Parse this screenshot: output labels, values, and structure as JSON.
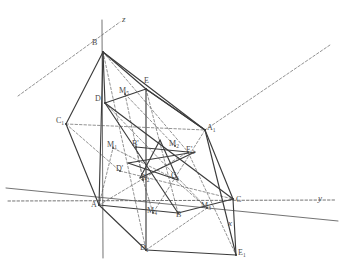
{
  "figure": {
    "width": 342,
    "height": 278,
    "background": "#ffffff",
    "solid_stroke": "#3c3c3c",
    "dashed_stroke": "#6e6e6e",
    "axis_stroke": "#5a5a5a",
    "label_color": "#4a4a4a"
  },
  "axes": [
    {
      "name": "z",
      "label": "z",
      "kind": "solid",
      "x1": 102,
      "y1": 20,
      "x2": 103,
      "y2": 258,
      "label_x": 122,
      "label_y": 20
    },
    {
      "name": "y",
      "label": "y",
      "kind": "dashed",
      "x1": 8,
      "y1": 201,
      "x2": 336,
      "y2": 200,
      "label_x": 318,
      "label_y": 199
    },
    {
      "name": "x",
      "label": "x",
      "kind": "solid",
      "x1": 6,
      "y1": 188,
      "x2": 338,
      "y2": 221,
      "label_x": 228,
      "label_y": 224
    }
  ],
  "points": [
    {
      "name": "A",
      "label": "A",
      "x": 99,
      "y": 205,
      "label_x": 91,
      "label_y": 206
    },
    {
      "name": "B",
      "label": "B",
      "x": 103,
      "y": 52,
      "label_x": 92,
      "label_y": 44
    },
    {
      "name": "C",
      "label": "C",
      "x": 233,
      "y": 199,
      "label_x": 236,
      "label_y": 201
    },
    {
      "name": "D",
      "label": "D",
      "x": 105,
      "y": 103,
      "label_x": 95,
      "label_y": 100
    },
    {
      "name": "E",
      "label": "E",
      "x": 146,
      "y": 89,
      "label_x": 144,
      "label_y": 82
    },
    {
      "name": "A1",
      "label": "A",
      "sub": "1",
      "x": 205,
      "y": 130,
      "label_x": 207,
      "label_y": 129
    },
    {
      "name": "C1",
      "label": "C",
      "sub": "1",
      "x": 66,
      "y": 124,
      "label_x": 56,
      "label_y": 122
    },
    {
      "name": "D1",
      "label": "D",
      "sub": "1",
      "x": 146,
      "y": 250,
      "label_x": 140,
      "label_y": 249
    },
    {
      "name": "E1",
      "label": "E",
      "sub": "1",
      "x": 236,
      "y": 255,
      "label_x": 238,
      "label_y": 254
    },
    {
      "name": "B2",
      "label": "B",
      "x": 178,
      "y": 213,
      "label_x": 176,
      "label_y": 216
    },
    {
      "name": "Bp",
      "label": "B",
      "prime": true,
      "x": 136,
      "y": 147,
      "label_x": 132,
      "label_y": 145
    },
    {
      "name": "Dp",
      "label": "D",
      "prime": true,
      "x": 120,
      "y": 171,
      "label_x": 116,
      "label_y": 170
    },
    {
      "name": "A2",
      "label": "A",
      "sub": "2",
      "x": 143,
      "y": 180,
      "label_x": 141,
      "label_y": 179
    },
    {
      "name": "C1b",
      "label": "C",
      "sub": "1",
      "x": 173,
      "y": 178,
      "label_x": 171,
      "label_y": 177
    },
    {
      "name": "E1p",
      "label": "E",
      "sub": "1",
      "prime": true,
      "x": 188,
      "y": 152,
      "label_x": 186,
      "label_y": 151
    },
    {
      "name": "M1",
      "label": "M",
      "sub": "1",
      "x": 113,
      "y": 148,
      "label_x": 107,
      "label_y": 146
    },
    {
      "name": "M2",
      "label": "M",
      "sub": "2",
      "x": 175,
      "y": 146,
      "label_x": 169,
      "label_y": 145
    },
    {
      "name": "M3",
      "label": "M",
      "sub": "3",
      "x": 207,
      "y": 208,
      "label_x": 201,
      "label_y": 207
    },
    {
      "name": "M4",
      "label": "M",
      "sub": "4",
      "x": 153,
      "y": 213,
      "label_x": 147,
      "label_y": 212
    },
    {
      "name": "M5",
      "label": "M",
      "sub": "5",
      "x": 125,
      "y": 94,
      "label_x": 119,
      "label_y": 92
    }
  ],
  "solid_edges": [
    {
      "name": "edge-B-C1",
      "x1": 103,
      "y1": 52,
      "x2": 66,
      "y2": 124
    },
    {
      "name": "edge-C1-A",
      "x1": 66,
      "y1": 124,
      "x2": 99,
      "y2": 205
    },
    {
      "name": "edge-B-D",
      "x1": 103,
      "y1": 52,
      "x2": 105,
      "y2": 103
    },
    {
      "name": "edge-B-E",
      "x1": 103,
      "y1": 52,
      "x2": 146,
      "y2": 89
    },
    {
      "name": "edge-D-E",
      "x1": 105,
      "y1": 103,
      "x2": 146,
      "y2": 89
    },
    {
      "name": "edge-B-A1",
      "x1": 103,
      "y1": 52,
      "x2": 205,
      "y2": 130
    },
    {
      "name": "edge-E-A1",
      "x1": 146,
      "y1": 89,
      "x2": 205,
      "y2": 130
    },
    {
      "name": "edge-A1-C",
      "x1": 205,
      "y1": 130,
      "x2": 233,
      "y2": 199
    },
    {
      "name": "edge-D-C",
      "x1": 105,
      "y1": 103,
      "x2": 233,
      "y2": 199
    },
    {
      "name": "edge-A-B2",
      "x1": 99,
      "y1": 205,
      "x2": 178,
      "y2": 213
    },
    {
      "name": "edge-B2-C",
      "x1": 178,
      "y1": 213,
      "x2": 233,
      "y2": 199
    },
    {
      "name": "edge-A-D1",
      "x1": 99,
      "y1": 205,
      "x2": 146,
      "y2": 250
    },
    {
      "name": "edge-D1-E1",
      "x1": 146,
      "y1": 250,
      "x2": 236,
      "y2": 255
    },
    {
      "name": "edge-E1-C",
      "x1": 236,
      "y1": 255,
      "x2": 233,
      "y2": 199
    },
    {
      "name": "edge-D-B2",
      "x1": 105,
      "y1": 103,
      "x2": 178,
      "y2": 213
    },
    {
      "name": "edge-E-D1",
      "x1": 146,
      "y1": 89,
      "x2": 146,
      "y2": 250
    },
    {
      "name": "edge-A1-E1",
      "x1": 205,
      "y1": 130,
      "x2": 236,
      "y2": 255
    },
    {
      "name": "edge-B-A",
      "x1": 103,
      "y1": 52,
      "x2": 99,
      "y2": 205
    },
    {
      "name": "edge-star-1",
      "x1": 128,
      "y1": 163,
      "x2": 195,
      "y2": 152
    },
    {
      "name": "edge-star-2",
      "x1": 195,
      "y1": 152,
      "x2": 140,
      "y2": 178
    },
    {
      "name": "edge-star-3",
      "x1": 140,
      "y1": 178,
      "x2": 160,
      "y2": 140
    },
    {
      "name": "edge-star-4",
      "x1": 160,
      "y1": 140,
      "x2": 178,
      "y2": 180
    },
    {
      "name": "edge-star-5",
      "x1": 178,
      "y1": 180,
      "x2": 128,
      "y2": 163
    },
    {
      "name": "edge-cross-1",
      "x1": 146,
      "y1": 89,
      "x2": 205,
      "y2": 130
    },
    {
      "name": "edge-cross-2",
      "x1": 136,
      "y1": 147,
      "x2": 188,
      "y2": 152
    }
  ],
  "dashed_edges": [
    {
      "name": "ray-upper-left",
      "x1": 18,
      "y1": 96,
      "x2": 120,
      "y2": 22
    },
    {
      "name": "ray-upper-right",
      "x1": 205,
      "y1": 130,
      "x2": 330,
      "y2": 45
    },
    {
      "name": "dash-C1-A1",
      "x1": 66,
      "y1": 124,
      "x2": 205,
      "y2": 130
    },
    {
      "name": "dash-A-E1p",
      "x1": 99,
      "y1": 205,
      "x2": 188,
      "y2": 152
    },
    {
      "name": "dash-B-D1",
      "x1": 103,
      "y1": 52,
      "x2": 146,
      "y2": 250
    },
    {
      "name": "dash-E-B2",
      "x1": 146,
      "y1": 89,
      "x2": 178,
      "y2": 213
    },
    {
      "name": "dash-D-M3",
      "x1": 105,
      "y1": 103,
      "x2": 207,
      "y2": 208
    },
    {
      "name": "dash-A1-M4",
      "x1": 205,
      "y1": 130,
      "x2": 153,
      "y2": 213
    },
    {
      "name": "dash-Bp-A2",
      "x1": 136,
      "y1": 147,
      "x2": 143,
      "y2": 180
    },
    {
      "name": "dash-M1-C1b",
      "x1": 113,
      "y1": 148,
      "x2": 173,
      "y2": 178
    },
    {
      "name": "dash-Dp-C",
      "x1": 120,
      "y1": 171,
      "x2": 233,
      "y2": 199
    },
    {
      "name": "dash-M5-A2",
      "x1": 125,
      "y1": 94,
      "x2": 143,
      "y2": 180
    },
    {
      "name": "dash-E1p-E1",
      "x1": 188,
      "y1": 152,
      "x2": 236,
      "y2": 255
    },
    {
      "name": "dash-C1b-M3",
      "x1": 173,
      "y1": 178,
      "x2": 207,
      "y2": 208
    },
    {
      "name": "dash-A2-M4",
      "x1": 143,
      "y1": 180,
      "x2": 153,
      "y2": 213
    },
    {
      "name": "dash-C1-Dp",
      "x1": 66,
      "y1": 124,
      "x2": 120,
      "y2": 171
    },
    {
      "name": "dash-B-E1p",
      "x1": 103,
      "y1": 52,
      "x2": 188,
      "y2": 152
    },
    {
      "name": "dash-M5-M2",
      "x1": 125,
      "y1": 94,
      "x2": 175,
      "y2": 146
    },
    {
      "name": "dash-A-M1",
      "x1": 99,
      "y1": 205,
      "x2": 113,
      "y2": 148
    },
    {
      "name": "dash-D1-M3",
      "x1": 146,
      "y1": 250,
      "x2": 207,
      "y2": 208
    }
  ]
}
